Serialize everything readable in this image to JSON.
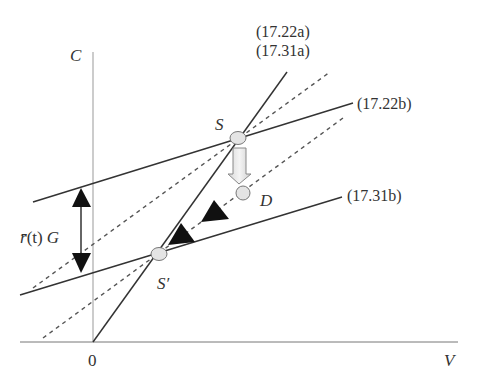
{
  "diagram": {
    "axes": {
      "y_label": "C",
      "x_label": "V",
      "origin_label": "0"
    },
    "lines": {
      "steep_line_label_1": "(17.22a)",
      "steep_line_label_2": "(17.31a)",
      "upper_line_label": "(17.22b)",
      "lower_line_label": "(17.31b)"
    },
    "points": {
      "S": "S",
      "S_prime": "S′",
      "D": "D"
    },
    "gap_label": {
      "r_bar": "r̄",
      "t_part": "(t)",
      "G": "G"
    },
    "colors": {
      "line": "#333333",
      "axis": "#777777",
      "dashed": "#555555",
      "point_fill": "#e4e4e4",
      "arrow_fill": "#111111"
    }
  }
}
